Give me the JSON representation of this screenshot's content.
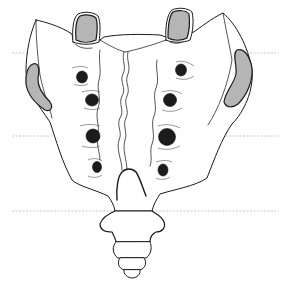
{
  "figure": {
    "colors": {
      "background": "#ffffff",
      "outline": "#1a1a1a",
      "facet_fill": "#b5b5b5",
      "foramen_fill": "#1c1c1c",
      "guide_line": "#b8b8b8"
    },
    "guide_lines": [
      {
        "y": 53,
        "x1": 12,
        "x2": 279,
        "style": "dashed"
      },
      {
        "y": 136,
        "x1": 12,
        "x2": 279,
        "style": "dashed"
      },
      {
        "y": 211,
        "x1": 12,
        "x2": 279,
        "style": "dashed"
      }
    ],
    "superior_articular_processes": [
      {
        "side": "left",
        "cx": 87,
        "cy": 28
      },
      {
        "side": "right",
        "cx": 179,
        "cy": 25
      }
    ],
    "auricular_surfaces": [
      {
        "side": "left"
      },
      {
        "side": "right"
      }
    ],
    "posterior_sacral_foramina": [
      {
        "side": "left",
        "cx": 82,
        "cy": 77,
        "r": 6
      },
      {
        "side": "left",
        "cx": 92,
        "cy": 100,
        "r": 6.5
      },
      {
        "side": "left",
        "cx": 93,
        "cy": 136,
        "r": 7
      },
      {
        "side": "left",
        "cx": 96,
        "cy": 167,
        "r": 5
      },
      {
        "side": "right",
        "cx": 181,
        "cy": 70,
        "r": 5.5
      },
      {
        "side": "right",
        "cx": 170,
        "cy": 100,
        "r": 6.5
      },
      {
        "side": "right",
        "cx": 167,
        "cy": 137,
        "r": 8.5
      },
      {
        "side": "right",
        "cx": 163,
        "cy": 170,
        "r": 5.5
      }
    ],
    "coccyx_segments": 4,
    "text_labels": []
  }
}
